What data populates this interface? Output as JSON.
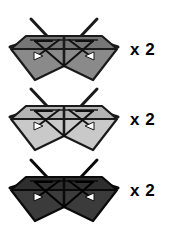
{
  "figure": {
    "type": "origami-assembly-diagram",
    "background_color": "#ffffff",
    "width": 175,
    "height": 238,
    "units": [
      {
        "id": "unit-medium-gray",
        "quantity_label": "x 2",
        "fill_color": "#8a8a8a",
        "fill_color_shaded": "#767676",
        "outline_color": "#1a1a1a",
        "fold_line_color": "#1a1a1a",
        "arrow_color": "#111111",
        "arrowhead_fill": "#ffffff"
      },
      {
        "id": "unit-light-gray",
        "quantity_label": "x 2",
        "fill_color": "#c9c9c9",
        "fill_color_shaded": "#b4b4b4",
        "outline_color": "#1a1a1a",
        "fold_line_color": "#1a1a1a",
        "arrow_color": "#111111",
        "arrowhead_fill": "#ffffff"
      },
      {
        "id": "unit-dark-gray",
        "quantity_label": "x 2",
        "fill_color": "#3b3b3b",
        "fill_color_shaded": "#2e2e2e",
        "outline_color": "#0a0a0a",
        "fold_line_color": "#0a0a0a",
        "arrow_color": "#000000",
        "arrowhead_fill": "#ffffff"
      }
    ]
  }
}
